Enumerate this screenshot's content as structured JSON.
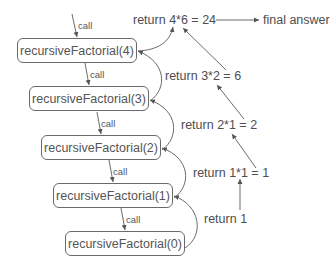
{
  "diagram": {
    "call_label": "call",
    "boxes": [
      {
        "label": "recursiveFactorial(4)"
      },
      {
        "label": "recursiveFactorial(3)"
      },
      {
        "label": "recursiveFactorial(2)"
      },
      {
        "label": "recursiveFactorial(1)"
      },
      {
        "label": "recursiveFactorial(0)"
      }
    ],
    "returns": [
      {
        "label": "return 4*6 = 24"
      },
      {
        "label": "return 3*2 = 6"
      },
      {
        "label": "return 2*1 = 2"
      },
      {
        "label": "return 1*1 = 1"
      },
      {
        "label": "return 1"
      }
    ],
    "final_label": "final answer",
    "colors": {
      "stroke": "#5a5a5a",
      "text": "#4e4e4e"
    }
  }
}
